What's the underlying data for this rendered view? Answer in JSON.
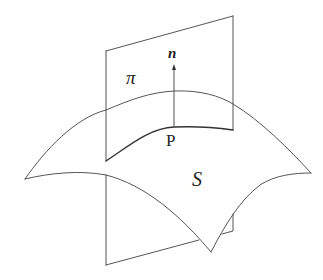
{
  "diagram": {
    "labels": {
      "plane": "π",
      "normal": "n",
      "point": "P",
      "surface": "S"
    },
    "colors": {
      "stroke": "#555555",
      "text": "#222222",
      "background": "#ffffff"
    }
  }
}
